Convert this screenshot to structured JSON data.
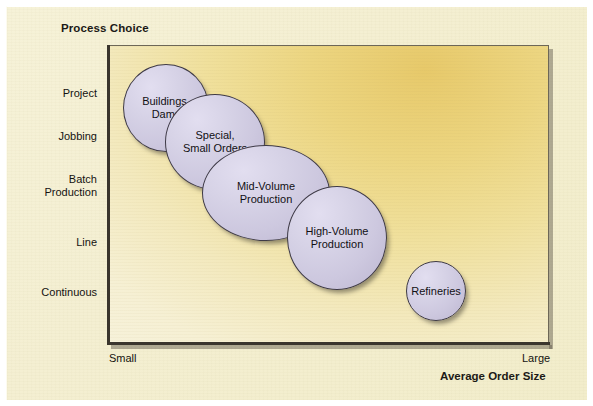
{
  "chart_data": {
    "type": "scatter",
    "title": "",
    "ylabel": "Process Choice",
    "xlabel": "Average Order Size",
    "y_categories": [
      "Project",
      "Jobbing",
      "Batch\nProduction",
      "Line",
      "Continuous"
    ],
    "x_ticks": [
      "Small",
      "Large"
    ],
    "grid": false,
    "legend": "none",
    "bubbles": [
      {
        "label": "Buildings,\nDams",
        "x": 166,
        "y": 108,
        "rx": 43,
        "ry": 44
      },
      {
        "label": "Special,\nSmall Orders",
        "x": 215,
        "y": 142,
        "rx": 50,
        "ry": 48
      },
      {
        "label": "Mid-Volume\nProduction",
        "x": 266,
        "y": 193,
        "rx": 64,
        "ry": 48
      },
      {
        "label": "High-Volume\nProduction",
        "x": 337,
        "y": 238,
        "rx": 50,
        "ry": 52
      },
      {
        "label": "Refineries",
        "x": 436,
        "y": 291,
        "rx": 30,
        "ry": 30
      }
    ]
  },
  "axes": {
    "y_title": "Process Choice",
    "x_title": "Average Order Size",
    "y_labels": [
      {
        "text": "Project",
        "y": 87
      },
      {
        "text": "Jobbing",
        "y": 130
      },
      {
        "text": "Batch\nProduction",
        "y": 173
      },
      {
        "text": "Line",
        "y": 236
      },
      {
        "text": "Continuous",
        "y": 286
      }
    ],
    "x_min_label": "Small",
    "x_max_label": "Large"
  },
  "colors": {
    "page_background": "#ffffff",
    "panel_background": "#f4efd2",
    "plot_gradient_start": "#e7c96a",
    "plot_gradient_end": "#f7f3de",
    "bubble_fill": "#cdc8df",
    "bubble_stroke": "#3e3a46",
    "axis_color": "#3a352d",
    "text_color": "#141210"
  }
}
